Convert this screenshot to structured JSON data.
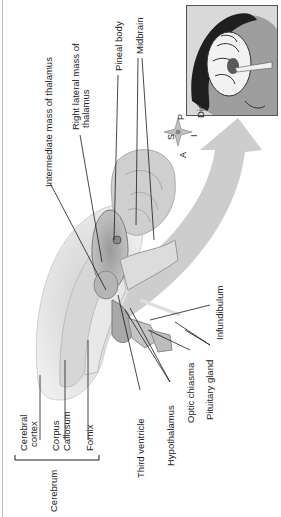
{
  "figure": {
    "orientation": "rotated 90 degrees counter-clockwise",
    "inset_label": "Diencephalon",
    "compass": {
      "S": "S",
      "P": "P",
      "A": "A",
      "I": "I"
    },
    "labels": {
      "intermediate_mass": "Intermediate mass of thalamus",
      "right_lateral_mass_line1": "Right lateral mass of",
      "right_lateral_mass_line2": "thalamus",
      "pineal_body": "Pineal body",
      "midbrain": "Midbrain",
      "cerebral_cortex_line1": "Cerebral",
      "cerebral_cortex_line2": "cortex",
      "corpus_callosum_line1": "Corpus",
      "corpus_callosum_line2": "Callosum",
      "fornix": "Fornix",
      "cerebrum": "Cerebrum",
      "third_ventricle": "Third ventricle",
      "hypothalamus": "Hypothalamus",
      "optic_chiasma": "Optic chiasma",
      "pituitary_gland": "Pituitary gland",
      "infundibulum": "Infundibulum"
    },
    "colors": {
      "line": "#1a1a1a",
      "arrow": "#c8c8c8",
      "tissue_light": "#e4e4e4",
      "tissue_mid": "#b9b9b9",
      "tissue_dark": "#8a8a8a",
      "inset_bg": "#d9d9d9",
      "inset_border": "#555555"
    }
  }
}
